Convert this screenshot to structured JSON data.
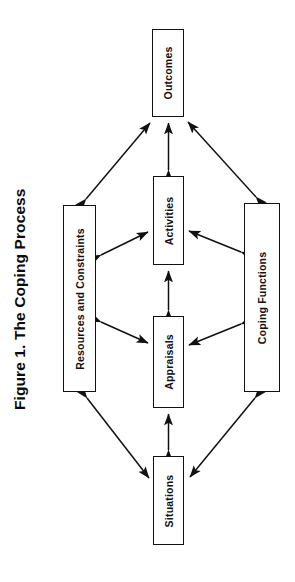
{
  "figure": {
    "title": "Figure 1. The Coping Process",
    "stroke_color": "#111111",
    "fill_color": "#ffffff",
    "text_color": "#111111",
    "rotation": "text rotated 90 degrees counter-clockwise",
    "nodes": [
      {
        "id": "outcomes",
        "label": "Outcomes",
        "x": 152,
        "y": 29,
        "w": 32,
        "h": 88
      },
      {
        "id": "activities",
        "label": "Activities",
        "x": 153,
        "y": 176,
        "w": 31,
        "h": 89
      },
      {
        "id": "appraisals",
        "label": "Appraisals",
        "x": 153,
        "y": 316,
        "w": 31,
        "h": 92
      },
      {
        "id": "situations",
        "label": "Situations",
        "x": 153,
        "y": 456,
        "w": 31,
        "h": 89
      },
      {
        "id": "resources",
        "label": "Resources and Constraints",
        "x": 63,
        "y": 205,
        "w": 33,
        "h": 187
      },
      {
        "id": "coping",
        "label": "Coping Functions",
        "x": 244,
        "y": 203,
        "w": 36,
        "h": 189
      }
    ],
    "edges": [
      {
        "from": "activities",
        "to": "outcomes",
        "style": "double-headed",
        "kind": "vertical"
      },
      {
        "from": "appraisals",
        "to": "activities",
        "style": "double-headed",
        "kind": "vertical"
      },
      {
        "from": "situations",
        "to": "appraisals",
        "style": "double-headed",
        "kind": "vertical"
      },
      {
        "from": "resources",
        "to": "outcomes",
        "style": "double-headed",
        "kind": "diagonal"
      },
      {
        "from": "coping",
        "to": "outcomes",
        "style": "double-headed",
        "kind": "diagonal"
      },
      {
        "from": "resources",
        "to": "activities",
        "style": "double-headed",
        "kind": "diagonal"
      },
      {
        "from": "coping",
        "to": "activities",
        "style": "double-headed",
        "kind": "diagonal"
      },
      {
        "from": "resources",
        "to": "appraisals",
        "style": "double-headed",
        "kind": "diagonal"
      },
      {
        "from": "coping",
        "to": "appraisals",
        "style": "double-headed",
        "kind": "diagonal"
      },
      {
        "from": "resources",
        "to": "situations",
        "style": "double-headed",
        "kind": "diagonal"
      },
      {
        "from": "coping",
        "to": "situations",
        "style": "double-headed",
        "kind": "diagonal"
      }
    ]
  }
}
